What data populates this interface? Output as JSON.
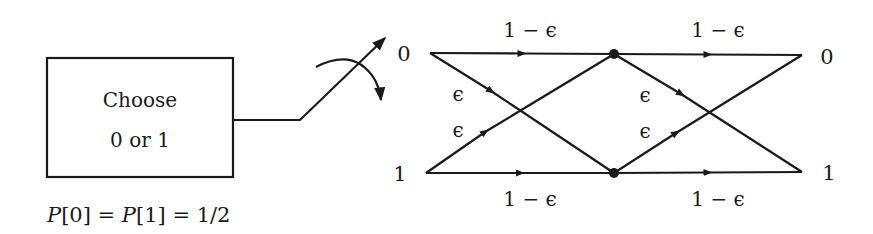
{
  "diagram": {
    "source_box": {
      "line1": "Choose",
      "line2": "0 or 1"
    },
    "probability_label": "P[0] = P[1] = 1/2",
    "switch_positions": [
      "0",
      "1"
    ],
    "input_labels": [
      "0",
      "1"
    ],
    "output_labels": [
      "0",
      "1"
    ],
    "stage1": {
      "top_straight": "1 − ϵ",
      "bottom_straight": "1 − ϵ",
      "cross_down": "ϵ",
      "cross_up": "ϵ"
    },
    "stage2": {
      "top_straight": "1 − ϵ",
      "bottom_straight": "1 − ϵ",
      "cross_down": "ϵ",
      "cross_up": "ϵ"
    },
    "colors": {
      "stroke": "#1a1a1a",
      "background": "#ffffff"
    }
  }
}
